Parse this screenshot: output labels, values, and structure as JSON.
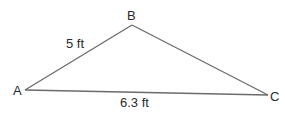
{
  "diagram": {
    "type": "triangle",
    "stroke_color": "#6b6b6b",
    "label_color": "#2b2b2b",
    "vertices": {
      "A": {
        "label": "A",
        "x": 25,
        "y": 90
      },
      "B": {
        "label": "B",
        "x": 132,
        "y": 25
      },
      "C": {
        "label": "C",
        "x": 268,
        "y": 95
      }
    },
    "sides": {
      "AB": {
        "label": "5 ft"
      },
      "AC": {
        "label": "6.3 ft"
      }
    }
  }
}
